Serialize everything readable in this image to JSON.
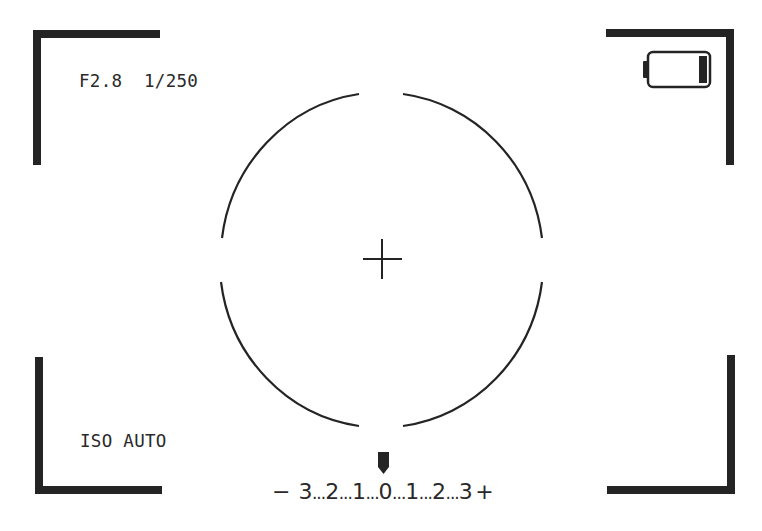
{
  "viewfinder": {
    "aperture": "F2.8",
    "shutter_speed": "1/250",
    "exposure_info": "F2.8  1/250",
    "iso": "ISO AUTO",
    "battery": {
      "icon": "battery-low-icon",
      "level": "low"
    },
    "focus_circle": {
      "icon": "focus-circle-icon"
    },
    "crosshair": {
      "icon": "crosshair-icon"
    },
    "exposure_scale": {
      "minus_sign": "−",
      "plus_sign": "+",
      "ticks": [
        "3",
        "2",
        "1",
        "0",
        "1",
        "2",
        "3"
      ],
      "separator": "...",
      "current_value": "0",
      "indicator_icon": "exposure-pointer-icon"
    },
    "colors": {
      "foreground": "#242424",
      "background": "#ffffff"
    }
  }
}
